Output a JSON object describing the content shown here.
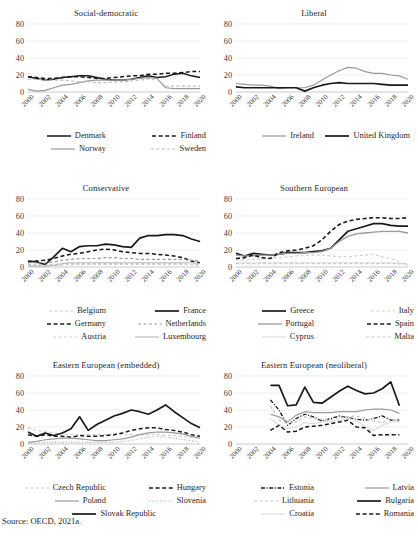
{
  "figure": {
    "source_note": "Source: OECD, 2021a.",
    "y_ticks": [
      "80",
      "60",
      "40",
      "20",
      "0"
    ],
    "x_ticks": [
      "2000",
      "2002",
      "2004",
      "2006",
      "2008",
      "2010",
      "2012",
      "2014",
      "2016",
      "2018",
      "2020"
    ],
    "ylim": [
      0,
      80
    ],
    "xlim": [
      2000,
      2020
    ],
    "colors": {
      "black": "#1a1a1a",
      "dark_gray": "#4d4d4d",
      "mid_gray": "#8c8c8c",
      "light_gray": "#b8b8b8",
      "pale_gray": "#d4d4d4",
      "grid": "#e2e2e2",
      "axis": "#bdbdbd"
    }
  },
  "chart_data": [
    {
      "type": "line",
      "title": "Social-democratic",
      "xlabel": "",
      "ylabel": "",
      "ylim": [
        0,
        80
      ],
      "grid": true,
      "legend_position": "bottom",
      "x": [
        2000,
        2001,
        2002,
        2003,
        2004,
        2005,
        2006,
        2007,
        2008,
        2009,
        2010,
        2011,
        2012,
        2013,
        2014,
        2015,
        2016,
        2017,
        2018,
        2019,
        2020
      ],
      "series": [
        {
          "name": "Denmark",
          "style": "solid",
          "color": "#1a1a1a",
          "width": 1.5,
          "values": [
            18,
            16,
            14,
            15,
            17,
            18,
            19,
            19,
            17,
            15,
            14,
            14,
            15,
            17,
            19,
            17,
            18,
            21,
            22,
            19,
            17
          ]
        },
        {
          "name": "Finland",
          "style": "dashed",
          "color": "#1a1a1a",
          "width": 1.5,
          "values": [
            18,
            17,
            16,
            16,
            17,
            18,
            18,
            17,
            16,
            16,
            17,
            18,
            19,
            19,
            21,
            21,
            22,
            22,
            23,
            24,
            24
          ]
        },
        {
          "name": "Norway",
          "style": "solid",
          "color": "#9a9a9a",
          "width": 1.2,
          "values": [
            3,
            1,
            2,
            5,
            8,
            9,
            11,
            13,
            14,
            14,
            14,
            14,
            15,
            16,
            17,
            16,
            5,
            4,
            4,
            4,
            4
          ]
        },
        {
          "name": "Sweden",
          "style": "dashed",
          "color": "#bcbcbc",
          "width": 1.2,
          "values": [
            15,
            15,
            14,
            14,
            14,
            13,
            12,
            12,
            11,
            11,
            12,
            12,
            13,
            14,
            15,
            15,
            7,
            7,
            7,
            7,
            7
          ]
        }
      ]
    },
    {
      "type": "line",
      "title": "Liberal",
      "xlabel": "",
      "ylabel": "",
      "ylim": [
        0,
        80
      ],
      "grid": true,
      "legend_position": "bottom",
      "x": [
        2000,
        2001,
        2002,
        2003,
        2004,
        2005,
        2006,
        2007,
        2008,
        2009,
        2010,
        2011,
        2012,
        2013,
        2014,
        2015,
        2016,
        2017,
        2018,
        2019,
        2020
      ],
      "series": [
        {
          "name": "Ireland",
          "style": "solid",
          "color": "#9a9a9a",
          "width": 1.2,
          "values": [
            10,
            9,
            8,
            8,
            7,
            4,
            5,
            5,
            5,
            8,
            14,
            20,
            25,
            29,
            28,
            24,
            22,
            22,
            20,
            19,
            15
          ]
        },
        {
          "name": "United Kingdom",
          "style": "solid",
          "color": "#1a1a1a",
          "width": 1.7,
          "values": [
            6,
            5,
            5,
            5,
            5,
            5,
            5,
            5,
            1,
            5,
            8,
            10,
            11,
            10,
            10,
            10,
            10,
            9,
            8,
            8,
            8
          ]
        }
      ]
    },
    {
      "type": "line",
      "title": "Conservative",
      "xlabel": "",
      "ylabel": "",
      "ylim": [
        0,
        80
      ],
      "grid": true,
      "legend_position": "bottom",
      "x": [
        2000,
        2001,
        2002,
        2003,
        2004,
        2005,
        2006,
        2007,
        2008,
        2009,
        2010,
        2011,
        2012,
        2013,
        2014,
        2015,
        2016,
        2017,
        2018,
        2019,
        2020
      ],
      "series": [
        {
          "name": "Belgium",
          "style": "dashed",
          "color": "#c6c6c6",
          "width": 1.2,
          "values": [
            3,
            3,
            3,
            3,
            4,
            4,
            4,
            4,
            4,
            4,
            4,
            4,
            4,
            4,
            4,
            4,
            4,
            4,
            4,
            3,
            2
          ]
        },
        {
          "name": "France",
          "style": "solid",
          "color": "#1a1a1a",
          "width": 1.7,
          "values": [
            7,
            6,
            3,
            12,
            22,
            18,
            24,
            25,
            25,
            27,
            26,
            24,
            23,
            34,
            37,
            37,
            38,
            38,
            37,
            33,
            30
          ]
        },
        {
          "name": "Germany",
          "style": "dashed",
          "color": "#1a1a1a",
          "width": 1.5,
          "values": [
            6,
            7,
            8,
            10,
            13,
            15,
            16,
            18,
            20,
            21,
            20,
            18,
            17,
            16,
            16,
            15,
            14,
            13,
            11,
            7,
            5
          ]
        },
        {
          "name": "Netherlands",
          "style": "dashed",
          "color": "#9a9a9a",
          "width": 1.2,
          "values": [
            5,
            5,
            5,
            6,
            8,
            9,
            10,
            10,
            10,
            11,
            11,
            10,
            10,
            9,
            9,
            9,
            9,
            9,
            9,
            8,
            7
          ]
        },
        {
          "name": "Austria",
          "style": "dashed",
          "color": "#d0d0d0",
          "width": 1.2,
          "values": [
            2,
            2,
            2,
            2,
            2,
            3,
            3,
            3,
            3,
            3,
            3,
            3,
            3,
            3,
            3,
            3,
            3,
            3,
            3,
            3,
            3
          ]
        },
        {
          "name": "Luxembourg",
          "style": "solid",
          "color": "#bcbcbc",
          "width": 1.2,
          "values": [
            1,
            1,
            1,
            2,
            4,
            5,
            5,
            5,
            5,
            5,
            5,
            5,
            5,
            5,
            5,
            5,
            5,
            5,
            5,
            5,
            4
          ]
        }
      ]
    },
    {
      "type": "line",
      "title": "Southern European",
      "xlabel": "",
      "ylabel": "",
      "ylim": [
        0,
        80
      ],
      "grid": true,
      "legend_position": "bottom",
      "x": [
        2000,
        2001,
        2002,
        2003,
        2004,
        2005,
        2006,
        2007,
        2008,
        2009,
        2010,
        2011,
        2012,
        2013,
        2014,
        2015,
        2016,
        2017,
        2018,
        2019,
        2020
      ],
      "series": [
        {
          "name": "Greece",
          "style": "solid",
          "color": "#1a1a1a",
          "width": 1.7,
          "values": [
            16,
            13,
            16,
            15,
            14,
            15,
            17,
            17,
            17,
            18,
            19,
            22,
            32,
            42,
            45,
            48,
            51,
            51,
            49,
            48,
            48
          ]
        },
        {
          "name": "Italy",
          "style": "dashed",
          "color": "#cfcfcf",
          "width": 1.2,
          "values": [
            9,
            8,
            9,
            9,
            10,
            11,
            12,
            13,
            14,
            14,
            14,
            13,
            12,
            12,
            13,
            14,
            15,
            12,
            10,
            6,
            2
          ]
        },
        {
          "name": "Portugal",
          "style": "solid",
          "color": "#9a9a9a",
          "width": 1.3,
          "values": [
            14,
            13,
            13,
            14,
            14,
            15,
            16,
            16,
            17,
            17,
            18,
            22,
            30,
            36,
            39,
            40,
            41,
            42,
            42,
            42,
            40
          ]
        },
        {
          "name": "Spain",
          "style": "dashed",
          "color": "#1a1a1a",
          "width": 1.6,
          "values": [
            10,
            11,
            14,
            11,
            10,
            17,
            19,
            20,
            22,
            25,
            32,
            42,
            50,
            54,
            56,
            57,
            58,
            58,
            57,
            57,
            58
          ]
        },
        {
          "name": "Cyprus",
          "style": "solid",
          "color": "#dcdcdc",
          "width": 1.2,
          "values": [
            5,
            5,
            5,
            5,
            5,
            5,
            5,
            5,
            5,
            5,
            5,
            5,
            5,
            5,
            5,
            5,
            5,
            5,
            5,
            4,
            3
          ]
        },
        {
          "name": "Malta",
          "style": "dashed",
          "color": "#cacaca",
          "width": 1.2,
          "values": [
            4,
            4,
            4,
            4,
            4,
            4,
            4,
            4,
            4,
            4,
            4,
            4,
            4,
            4,
            4,
            4,
            4,
            4,
            4,
            4,
            4
          ]
        }
      ]
    },
    {
      "type": "line",
      "title": "Eastern European (embedded)",
      "xlabel": "",
      "ylabel": "",
      "ylim": [
        0,
        80
      ],
      "grid": true,
      "legend_position": "bottom",
      "x": [
        2000,
        2001,
        2002,
        2003,
        2004,
        2005,
        2006,
        2007,
        2008,
        2009,
        2010,
        2011,
        2012,
        2013,
        2014,
        2015,
        2016,
        2017,
        2018,
        2019,
        2020
      ],
      "series": [
        {
          "name": "Czech Republic",
          "style": "dashed",
          "color": "#cfcfcf",
          "width": 1.2,
          "values": [
            19,
            16,
            15,
            13,
            12,
            11,
            11,
            11,
            11,
            11,
            11,
            11,
            11,
            11,
            11,
            11,
            10,
            10,
            9,
            8,
            7
          ]
        },
        {
          "name": "Hungary",
          "style": "dashed",
          "color": "#1a1a1a",
          "width": 1.5,
          "values": [
            11,
            9,
            11,
            9,
            9,
            8,
            10,
            9,
            9,
            10,
            11,
            13,
            16,
            18,
            19,
            19,
            17,
            16,
            14,
            11,
            9
          ]
        },
        {
          "name": "Poland",
          "style": "solid",
          "color": "#9a9a9a",
          "width": 1.2,
          "values": [
            2,
            3,
            5,
            6,
            7,
            7,
            6,
            5,
            4,
            4,
            5,
            6,
            8,
            11,
            13,
            14,
            14,
            13,
            12,
            9,
            7
          ]
        },
        {
          "name": "Slovenia",
          "style": "dotted",
          "color": "#b0b0b0",
          "width": 1.2,
          "values": [
            1,
            1,
            2,
            2,
            2,
            2,
            2,
            2,
            2,
            2,
            2,
            3,
            4,
            6,
            8,
            9,
            8,
            7,
            5,
            4,
            2
          ]
        },
        {
          "name": "Slovak Republic",
          "style": "solid",
          "color": "#1a1a1a",
          "width": 1.7,
          "values": [
            14,
            9,
            13,
            10,
            13,
            18,
            32,
            16,
            23,
            28,
            33,
            36,
            40,
            38,
            35,
            40,
            46,
            38,
            31,
            24,
            19
          ]
        }
      ]
    },
    {
      "type": "line",
      "title": "Eastern European (neoliberal)",
      "xlabel": "",
      "ylabel": "",
      "ylim": [
        0,
        80
      ],
      "grid": true,
      "legend_position": "bottom",
      "x": [
        2004,
        2005,
        2006,
        2007,
        2008,
        2009,
        2010,
        2011,
        2012,
        2013,
        2014,
        2015,
        2016,
        2017,
        2018,
        2019
      ],
      "series": [
        {
          "name": "Estonia",
          "style": "dashdot",
          "color": "#1a1a1a",
          "width": 1.3,
          "values": [
            52,
            40,
            22,
            30,
            35,
            32,
            27,
            30,
            33,
            31,
            29,
            28,
            30,
            33,
            28,
            28
          ]
        },
        {
          "name": "Latvia",
          "style": "solid",
          "color": "#9a9a9a",
          "width": 1.2,
          "values": [
            35,
            32,
            26,
            34,
            38,
            37,
            37,
            37,
            38,
            38,
            38,
            40,
            41,
            41,
            40,
            36
          ]
        },
        {
          "name": "Lithuania",
          "style": "dashed",
          "color": "#c4c4c4",
          "width": 1.2,
          "values": [
            45,
            28,
            25,
            26,
            32,
            30,
            29,
            28,
            31,
            32,
            33,
            30,
            27,
            25,
            30,
            26
          ]
        },
        {
          "name": "Bulgaria",
          "style": "solid",
          "color": "#1a1a1a",
          "width": 1.7,
          "values": [
            69,
            69,
            45,
            46,
            67,
            49,
            48,
            55,
            62,
            68,
            63,
            59,
            60,
            65,
            73,
            45
          ]
        },
        {
          "name": "Croatia",
          "style": "solid",
          "color": "#dcdcdc",
          "width": 1.2,
          "values": [
            30,
            22,
            18,
            20,
            25,
            24,
            26,
            27,
            28,
            30,
            28,
            20,
            16,
            22,
            26,
            27
          ]
        },
        {
          "name": "Romania",
          "style": "dashed",
          "color": "#1a1a1a",
          "width": 1.5,
          "values": [
            16,
            22,
            14,
            15,
            20,
            21,
            22,
            24,
            26,
            28,
            20,
            19,
            10,
            11,
            11,
            11
          ]
        }
      ]
    }
  ]
}
